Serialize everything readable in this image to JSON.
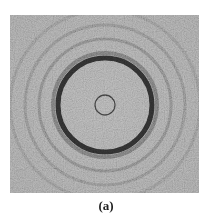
{
  "figure": {
    "caption": "(a)",
    "panel": {
      "description": "Grayscale speckled micrograph showing concentric interference rings around a small central circle",
      "background_color": "#9c9c9c",
      "center": [
        95,
        90
      ],
      "rings": [
        {
          "name": "central-small-circle",
          "radius": 10,
          "color": "#3a3a3a",
          "width": 1.3
        },
        {
          "name": "main-dark-ring",
          "radius": 47,
          "color": "#2a2a2a",
          "width": 5
        },
        {
          "name": "main-ring-halo",
          "radius": 52,
          "color": "#6e6e6e",
          "width": 4
        },
        {
          "name": "second-ring",
          "radius": 66,
          "color": "#7a7a7a",
          "width": 3
        },
        {
          "name": "third-ring",
          "radius": 80,
          "color": "#7f7f7f",
          "width": 3
        },
        {
          "name": "fourth-ring",
          "radius": 95,
          "color": "#858585",
          "width": 3
        }
      ]
    }
  }
}
